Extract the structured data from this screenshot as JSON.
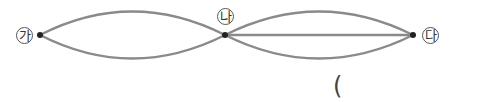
{
  "diagram": {
    "nodes": [
      {
        "id": "ga",
        "label": "가",
        "x": 40,
        "y": 35
      },
      {
        "id": "na",
        "label": "나",
        "x": 225,
        "y": 35
      },
      {
        "id": "da",
        "label": "다",
        "x": 413,
        "y": 35
      }
    ],
    "edges": [
      {
        "from": "ga",
        "to": "na",
        "shape": "upper-arc"
      },
      {
        "from": "ga",
        "to": "na",
        "shape": "lower-arc"
      },
      {
        "from": "na",
        "to": "da",
        "shape": "upper-arc"
      },
      {
        "from": "na",
        "to": "da",
        "shape": "straight"
      },
      {
        "from": "na",
        "to": "da",
        "shape": "lower-arc"
      }
    ],
    "answer_paren": "("
  }
}
